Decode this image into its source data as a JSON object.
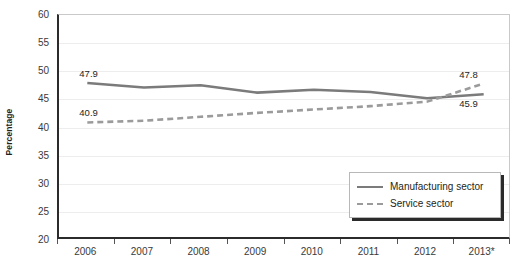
{
  "chart_data": {
    "type": "line",
    "title": "",
    "xlabel": "",
    "ylabel": "Percentage",
    "categories": [
      "2006",
      "2007",
      "2008",
      "2009",
      "2010",
      "2011",
      "2012",
      "2013*"
    ],
    "ylim": [
      20,
      60
    ],
    "yticks": [
      20,
      25,
      30,
      35,
      40,
      45,
      50,
      55,
      60
    ],
    "grid": true,
    "legend_position": "bottom-right",
    "series": [
      {
        "name": "Manufacturing sector",
        "style": "solid",
        "color": "#7b7b7b",
        "values": [
          47.9,
          47.1,
          47.5,
          46.2,
          46.7,
          46.3,
          45.2,
          45.9
        ]
      },
      {
        "name": "Service sector",
        "style": "dashed",
        "color": "#9b9b9b",
        "values": [
          40.9,
          41.2,
          41.9,
          42.6,
          43.2,
          43.8,
          44.6,
          47.8
        ]
      }
    ],
    "point_labels": [
      {
        "text": "47.9",
        "series": "Manufacturing sector",
        "category": "2006"
      },
      {
        "text": "40.9",
        "series": "Service sector",
        "category": "2006"
      },
      {
        "text": "47.8",
        "series": "Service sector",
        "category": "2013*"
      },
      {
        "text": "45.9",
        "series": "Manufacturing sector",
        "category": "2013*"
      }
    ]
  },
  "legend": {
    "items": [
      {
        "label": "Manufacturing sector"
      },
      {
        "label": "Service sector"
      }
    ]
  }
}
